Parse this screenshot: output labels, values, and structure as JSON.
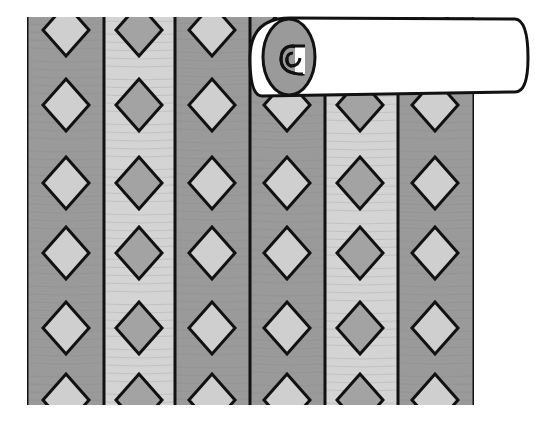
{
  "illustration": {
    "subject": "wallpaper strips with diamond pattern and rolled-up top",
    "colors": {
      "dark_stripe": "#9a9a9a",
      "light_stripe": "#d4d4d4",
      "diamond_on_dark": "#cfcfcf",
      "diamond_on_light": "#a3a3a3",
      "outline": "#111111",
      "roll": "#ffffff",
      "texture": "#8a8a8a"
    },
    "strips": [
      {
        "x0": 27,
        "x1": 104,
        "tone": "dark",
        "diamond_x": 66
      },
      {
        "x0": 104,
        "x1": 175,
        "tone": "light",
        "diamond_x": 139
      },
      {
        "x0": 175,
        "x1": 250,
        "tone": "dark",
        "diamond_x": 212
      },
      {
        "x0": 250,
        "x1": 325,
        "tone": "dark",
        "diamond_x": 287
      },
      {
        "x0": 325,
        "x1": 398,
        "tone": "light",
        "diamond_x": 360
      },
      {
        "x0": 398,
        "x1": 474,
        "tone": "dark",
        "diamond_x": 435
      }
    ],
    "diamond_rows_y": [
      30,
      105,
      183,
      253,
      328,
      400
    ],
    "top_y": 17,
    "bottom_y": 405
  }
}
